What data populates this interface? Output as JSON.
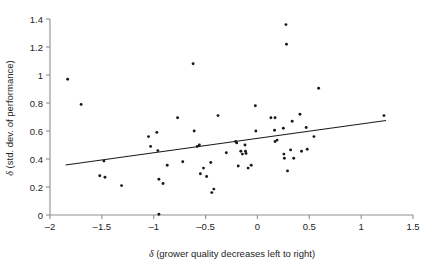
{
  "chart_data": {
    "type": "scatter",
    "title": "",
    "xlabel": "δ (grower quality decreases left to right)",
    "ylabel": "δ (std. dev. of performance)",
    "xlim": [
      -2,
      1.5
    ],
    "ylim": [
      0,
      1.4
    ],
    "xticks": [
      -2,
      -1.5,
      -1,
      -0.5,
      0,
      0.5,
      1,
      1.5
    ],
    "xticklabels": [
      "–2",
      "–1.5",
      "–1",
      "–0.5",
      "0",
      "0.5",
      "1",
      "1.5"
    ],
    "yticks": [
      0,
      0.2,
      0.4,
      0.6,
      0.8,
      1,
      1.2,
      1.4
    ],
    "yticklabels": [
      "0",
      "0.2",
      "0.4",
      "0.6",
      "0.8",
      "1",
      "1.2",
      "1.4"
    ],
    "grid": false,
    "legend": null,
    "point_color": "#1a1a1a",
    "line_color": "#1a1a1a",
    "axis_color": "#8f8f8f",
    "series": [
      {
        "name": "observations",
        "marker": "dot",
        "points": [
          [
            -1.83,
            0.97
          ],
          [
            -1.7,
            0.79
          ],
          [
            -1.52,
            0.28
          ],
          [
            -1.47,
            0.27
          ],
          [
            -1.48,
            0.385
          ],
          [
            -1.31,
            0.21
          ],
          [
            -1.05,
            0.56
          ],
          [
            -1.03,
            0.49
          ],
          [
            -0.97,
            0.59
          ],
          [
            -0.96,
            0.46
          ],
          [
            -0.95,
            0.255
          ],
          [
            -0.95,
            0.005
          ],
          [
            -0.91,
            0.225
          ],
          [
            -0.87,
            0.355
          ],
          [
            -0.77,
            0.695
          ],
          [
            -0.72,
            0.38
          ],
          [
            -0.62,
            1.08
          ],
          [
            -0.61,
            0.6
          ],
          [
            -0.58,
            0.49
          ],
          [
            -0.56,
            0.5
          ],
          [
            -0.55,
            0.295
          ],
          [
            -0.52,
            0.335
          ],
          [
            -0.49,
            0.275
          ],
          [
            -0.45,
            0.375
          ],
          [
            -0.44,
            0.16
          ],
          [
            -0.42,
            0.185
          ],
          [
            -0.38,
            0.71
          ],
          [
            -0.3,
            0.445
          ],
          [
            -0.21,
            0.525
          ],
          [
            -0.2,
            0.515
          ],
          [
            -0.185,
            0.35
          ],
          [
            -0.16,
            0.455
          ],
          [
            -0.145,
            0.435
          ],
          [
            -0.12,
            0.5
          ],
          [
            -0.115,
            0.455
          ],
          [
            -0.11,
            0.44
          ],
          [
            -0.09,
            0.335
          ],
          [
            -0.06,
            0.355
          ],
          [
            -0.02,
            0.78
          ],
          [
            -0.015,
            0.6
          ],
          [
            0.13,
            0.695
          ],
          [
            0.17,
            0.695
          ],
          [
            0.165,
            0.605
          ],
          [
            0.17,
            0.525
          ],
          [
            0.19,
            0.535
          ],
          [
            0.25,
            0.62
          ],
          [
            0.255,
            0.435
          ],
          [
            0.26,
            0.405
          ],
          [
            0.275,
            1.36
          ],
          [
            0.28,
            1.22
          ],
          [
            0.29,
            0.315
          ],
          [
            0.32,
            0.465
          ],
          [
            0.335,
            0.67
          ],
          [
            0.35,
            0.405
          ],
          [
            0.41,
            0.72
          ],
          [
            0.425,
            0.455
          ],
          [
            0.47,
            0.625
          ],
          [
            0.48,
            0.47
          ],
          [
            0.545,
            0.56
          ],
          [
            0.59,
            0.905
          ],
          [
            1.22,
            0.71
          ]
        ]
      }
    ],
    "trend_line": {
      "name": "fitted regression line",
      "x_start": -1.85,
      "y_start": 0.357,
      "x_end": 1.24,
      "y_end": 0.675
    }
  }
}
